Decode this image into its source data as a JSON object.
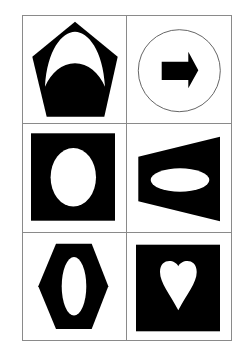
{
  "figure": {
    "title": "",
    "rows": 3,
    "columns": 2,
    "grid": {
      "x": 22,
      "y": 15,
      "width": 209,
      "height": 325,
      "col_divider_x": 126,
      "row_dividers_y": [
        123,
        232
      ],
      "line_color": "#8a8a8a"
    },
    "fill_color": "#000000",
    "cutout_color": "#ffffff",
    "cells": [
      {
        "row": 1,
        "col": 1,
        "outer_shape": "pentagon",
        "outer_fill": "black",
        "inner_shape": "crescent-arch",
        "inner_fill": "white"
      },
      {
        "row": 1,
        "col": 2,
        "outer_shape": "circle",
        "outer_fill": "white-outlined",
        "inner_shape": "right-arrow",
        "inner_fill": "black"
      },
      {
        "row": 2,
        "col": 1,
        "outer_shape": "square",
        "outer_fill": "black",
        "inner_shape": "vertical-ellipse",
        "inner_fill": "white"
      },
      {
        "row": 2,
        "col": 2,
        "outer_shape": "trapezoid",
        "outer_fill": "black",
        "inner_shape": "horizontal-ellipse",
        "inner_fill": "white"
      },
      {
        "row": 3,
        "col": 1,
        "outer_shape": "hexagon",
        "outer_fill": "black",
        "inner_shape": "narrow-vertical-ellipse",
        "inner_fill": "white"
      },
      {
        "row": 3,
        "col": 2,
        "outer_shape": "square",
        "outer_fill": "black",
        "inner_shape": "heart",
        "inner_fill": "white"
      }
    ]
  }
}
